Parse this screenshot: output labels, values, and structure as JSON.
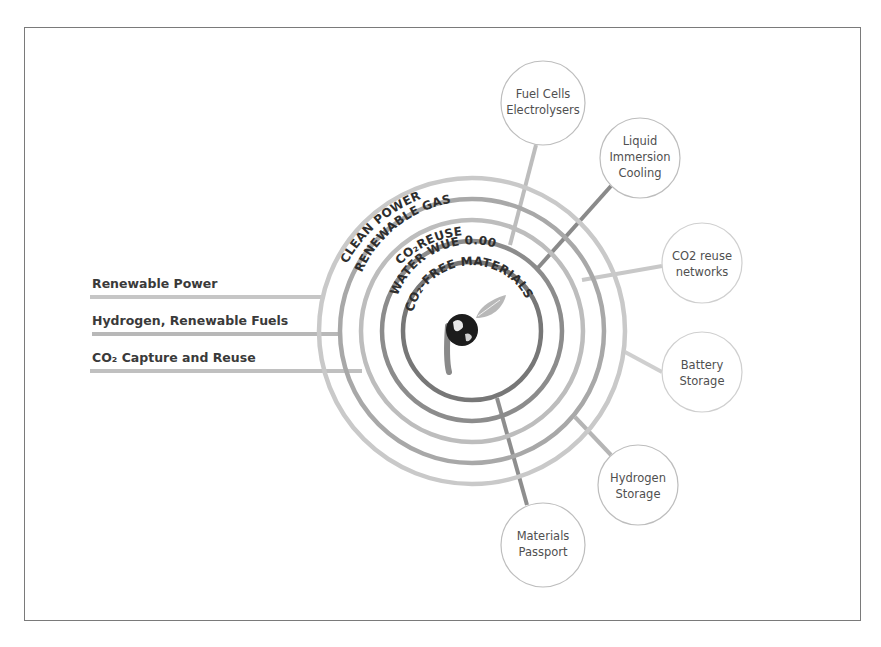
{
  "diagram": {
    "center": {
      "x": 472,
      "y": 331
    },
    "logo": {
      "name": "globe-leaf-logo"
    },
    "rings": [
      {
        "label": "CLEAN POWER",
        "radius": 153,
        "color": "#c8c8c8"
      },
      {
        "label": "RENEWABLE GAS",
        "radius": 132,
        "color": "#a9a9a9"
      },
      {
        "label": "CO₂REUSE",
        "radius": 111,
        "color": "#bdbdbd"
      },
      {
        "label": "WATER WUE 0.00",
        "radius": 90,
        "color": "#8e8e8e"
      },
      {
        "label": "CO₂-FREE MATERIALS",
        "radius": 69,
        "color": "#7a7a7a"
      }
    ],
    "inputs": [
      {
        "label": "Renewable Power",
        "y": 297
      },
      {
        "label": "Hydrogen, Renewable Fuels",
        "y": 334
      },
      {
        "label": "CO₂ Capture and Reuse",
        "y": 371
      }
    ],
    "outputs": [
      {
        "line1": "Fuel Cells",
        "line2": "Electrolysers",
        "line3": "",
        "cx": 543,
        "cy": 103,
        "r": 42
      },
      {
        "line1": "Liquid",
        "line2": "Immersion",
        "line3": "Cooling",
        "cx": 640,
        "cy": 158,
        "r": 40
      },
      {
        "line1": "CO2 reuse",
        "line2": "networks",
        "line3": "",
        "cx": 702,
        "cy": 263,
        "r": 40
      },
      {
        "line1": "Battery",
        "line2": "Storage",
        "line3": "",
        "cx": 702,
        "cy": 372,
        "r": 40
      },
      {
        "line1": "Hydrogen",
        "line2": "Storage",
        "line3": "",
        "cx": 638,
        "cy": 485,
        "r": 40
      },
      {
        "line1": "Materials",
        "line2": "Passport",
        "line3": "",
        "cx": 543,
        "cy": 545,
        "r": 42
      }
    ]
  }
}
